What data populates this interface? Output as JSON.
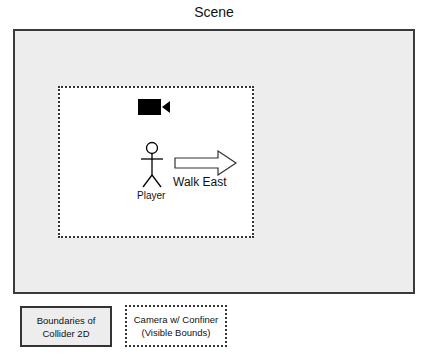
{
  "title": "Scene",
  "diagram": {
    "camera_icon": "video-camera-icon",
    "player": {
      "label": "Player",
      "icon": "stick-figure-icon"
    },
    "action": {
      "label": "Walk East",
      "icon": "arrow-right-outline-icon"
    }
  },
  "legend": [
    {
      "line1": "Boundaries of",
      "line2": "Collider 2D",
      "style": "solid"
    },
    {
      "line1": "Camera w/ Confiner",
      "line2": "(Visible Bounds)",
      "style": "dotted"
    }
  ]
}
